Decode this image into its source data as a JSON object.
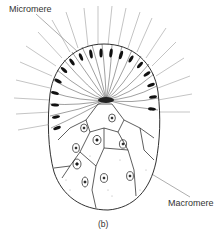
{
  "figure": {
    "panel_label": "(b)",
    "labels": {
      "micromere": "Micromere",
      "macromere": "Macromere"
    },
    "colors": {
      "ink": "#1a1a1a",
      "label_text": "#333333",
      "background": "#ffffff"
    }
  }
}
